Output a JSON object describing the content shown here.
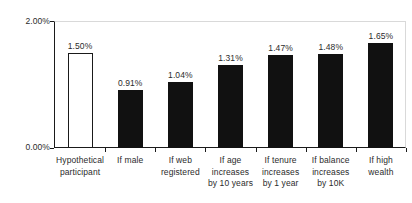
{
  "chart_data": {
    "type": "bar",
    "title": "",
    "subtitle": "",
    "xlabel": "",
    "ylabel": "",
    "ylim": [
      0,
      2
    ],
    "yunit": "%",
    "grid": false,
    "legend": null,
    "axis": {
      "y_ticks": [
        "0.00%",
        "2.00%"
      ],
      "y_tick_values": [
        0,
        2
      ]
    },
    "categories": [
      "Hypothetical participant",
      "If male",
      "If web registered",
      "If age increases by 10 years",
      "If tenure increases by 1 year",
      "If balance increases by 10K",
      "If high wealth"
    ],
    "category_label_lines": [
      [
        "Hypothetical",
        "participant"
      ],
      [
        "If male"
      ],
      [
        "If web",
        "registered"
      ],
      [
        "If age",
        "increases",
        "by 10 years"
      ],
      [
        "If tenure",
        "increases",
        "by 1 year"
      ],
      [
        "If balance",
        "increases",
        "by 10K"
      ],
      [
        "If high",
        "wealth"
      ]
    ],
    "values": [
      1.5,
      0.91,
      1.04,
      1.31,
      1.47,
      1.48,
      1.65
    ],
    "value_labels": [
      "1.50%",
      "0.91%",
      "1.04%",
      "1.31%",
      "1.47%",
      "1.48%",
      "1.65%"
    ],
    "bar_styles": [
      "hollow",
      "filled",
      "filled",
      "filled",
      "filled",
      "filled",
      "filled"
    ],
    "colors": {
      "bar_fill": "#111111",
      "bar_hollow_fill": "#ffffff",
      "bar_outline": "#1a1a1a",
      "axis": "#1a1a1a",
      "plot_border": "#d9d9d9",
      "text": "#2b2b2b",
      "background": "#ffffff"
    }
  }
}
